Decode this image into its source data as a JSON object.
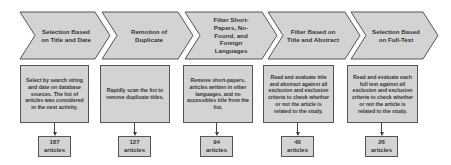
{
  "steps": [
    {
      "title": "Selection Based on Title and Date",
      "description": "Select by search string and date on database sources. The list of articles was considered in the next activity.",
      "count": "187",
      "count_unit": "articles"
    },
    {
      "title": "Remotion of Duplicate",
      "description": "Rapidly scan the list to remove duplicate titles.",
      "count": "127",
      "count_unit": "articles"
    },
    {
      "title": "Filter Short-Papers, No-Found, and Foreign Languages",
      "description": "Remove short-papers, articles written in other languages, and no accessibles title from the list.",
      "count": "94",
      "count_unit": "articles"
    },
    {
      "title": "Filter Based on Title and Abstract",
      "description": "Read and evaluate title and abstract against all exclusion and exclusion criteria to check whether or not the article is related to the study.",
      "count": "40",
      "count_unit": "articles"
    },
    {
      "title": "Selection Based on Full-Text",
      "description": "Read and evaluate each full text against all exclusion and exclusion criteria to check whether or not the article is related to the study.",
      "count": "26",
      "count_unit": "articles"
    }
  ],
  "colors": {
    "fill": "#d3d3d3",
    "stroke": "#555555",
    "text": "#333333"
  }
}
